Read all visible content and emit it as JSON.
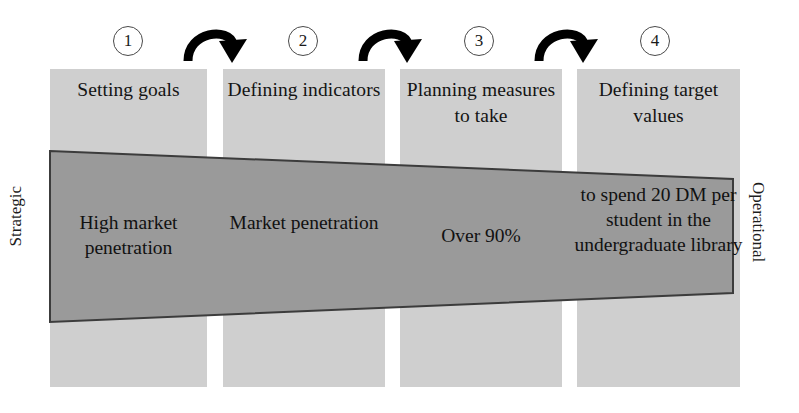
{
  "diagram": {
    "axis_left_label": "Strategic",
    "axis_right_label": "Operational",
    "colors": {
      "column_fill": "#cfcfcf",
      "trapezoid_fill": "#9a9a9a",
      "trapezoid_stroke": "#3c3c3c",
      "text": "#111111",
      "arrow": "#000000",
      "circle_stroke": "#4a4a4a",
      "background": "#ffffff"
    },
    "steps": [
      {
        "number": "1",
        "header": "Setting goals",
        "example": "High market penetration"
      },
      {
        "number": "2",
        "header": "Defining indicators",
        "example": "Market penetration"
      },
      {
        "number": "3",
        "header": "Planning measures to take",
        "example": "Over 90%"
      },
      {
        "number": "4",
        "header": "Defining target values",
        "example": "to spend 20 DM per student in the undergraduate library"
      }
    ],
    "arrows": [
      {
        "name": "arrow-step-1-to-2",
        "direction": "curved-right"
      },
      {
        "name": "arrow-step-2-to-3",
        "direction": "curved-right"
      },
      {
        "name": "arrow-step-3-to-4",
        "direction": "curved-right"
      }
    ]
  }
}
